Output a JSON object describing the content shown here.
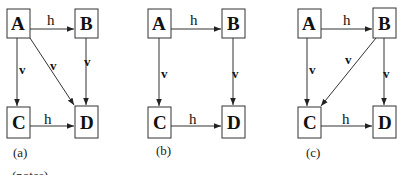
{
  "diagrams": [
    {
      "caption": "(a)",
      "nodes": {
        "A": "A",
        "B": "B",
        "C": "C",
        "D": "D"
      },
      "edges": [
        {
          "from": "A",
          "to": "B",
          "label": "h"
        },
        {
          "from": "A",
          "to": "C",
          "label": "v"
        },
        {
          "from": "A",
          "to": "D",
          "label": "v"
        },
        {
          "from": "B",
          "to": "D",
          "label": "v"
        },
        {
          "from": "C",
          "to": "D",
          "label": "h"
        }
      ]
    },
    {
      "caption": "(b)",
      "nodes": {
        "A": "A",
        "B": "B",
        "C": "C",
        "D": "D"
      },
      "edges": [
        {
          "from": "A",
          "to": "B",
          "label": "h"
        },
        {
          "from": "A",
          "to": "C",
          "label": "v"
        },
        {
          "from": "B",
          "to": "D",
          "label": "v"
        },
        {
          "from": "C",
          "to": "D",
          "label": "h"
        }
      ]
    },
    {
      "caption": "(c)",
      "nodes": {
        "A": "A",
        "B": "B",
        "C": "C",
        "D": "D"
      },
      "edges": [
        {
          "from": "A",
          "to": "B",
          "label": "h"
        },
        {
          "from": "A",
          "to": "C",
          "label": "v"
        },
        {
          "from": "B",
          "to": "C",
          "label": "v"
        },
        {
          "from": "B",
          "to": "D",
          "label": "v"
        },
        {
          "from": "C",
          "to": "D",
          "label": "h"
        }
      ]
    }
  ],
  "footer_text": "(notes)"
}
